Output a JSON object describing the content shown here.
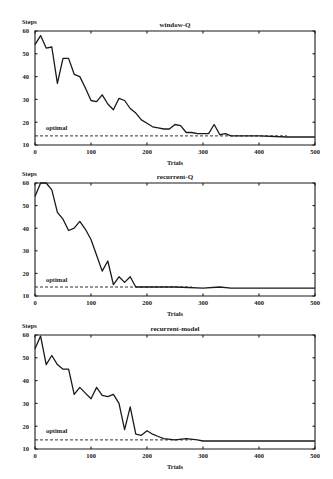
{
  "chart_data": [
    {
      "type": "line",
      "title": "window-Q",
      "xlabel": "Trials",
      "ylabel": "Steps",
      "xlim": [
        0,
        500
      ],
      "ylim": [
        10,
        60
      ],
      "xticks": [
        0,
        100,
        200,
        300,
        400,
        500
      ],
      "yticks": [
        10,
        20,
        30,
        40,
        50,
        60
      ],
      "grid": false,
      "annotations": [
        {
          "text": "optimal",
          "y": 14
        }
      ],
      "series": [
        {
          "name": "window-Q",
          "x": [
            0,
            10,
            20,
            30,
            40,
            50,
            60,
            70,
            80,
            90,
            100,
            110,
            120,
            130,
            140,
            150,
            160,
            170,
            180,
            190,
            200,
            210,
            220,
            230,
            240,
            250,
            260,
            270,
            280,
            290,
            300,
            310,
            320,
            330,
            340,
            350,
            400,
            450,
            500
          ],
          "values": [
            54,
            58,
            52.5,
            53,
            37,
            48,
            48,
            41,
            40,
            35,
            29.5,
            29,
            32,
            28,
            25.5,
            30.5,
            29.5,
            26,
            24,
            21,
            19.5,
            18,
            17.5,
            17,
            17,
            19,
            18.5,
            15.5,
            15.5,
            15,
            15,
            15,
            19,
            14.5,
            15,
            14,
            14,
            13.5,
            13.5
          ]
        },
        {
          "name": "optimal",
          "x": [
            0,
            450
          ],
          "values": [
            14,
            14
          ],
          "style": "dashed"
        }
      ]
    },
    {
      "type": "line",
      "title": "recurrent-Q",
      "xlabel": "Trials",
      "ylabel": "Steps",
      "xlim": [
        0,
        500
      ],
      "ylim": [
        10,
        60
      ],
      "xticks": [
        0,
        100,
        200,
        300,
        400,
        500
      ],
      "yticks": [
        10,
        20,
        30,
        40,
        50,
        60
      ],
      "grid": false,
      "annotations": [
        {
          "text": "optimal",
          "y": 14
        }
      ],
      "series": [
        {
          "name": "recurrent-Q",
          "x": [
            0,
            10,
            20,
            30,
            40,
            50,
            60,
            70,
            80,
            90,
            100,
            110,
            120,
            130,
            140,
            150,
            160,
            170,
            180,
            200,
            250,
            300,
            330,
            350,
            500
          ],
          "values": [
            54,
            60,
            60,
            57,
            47,
            44,
            39,
            40,
            43,
            39.5,
            35,
            28,
            21,
            25.5,
            15,
            18.5,
            16,
            18.5,
            14,
            14,
            14,
            13.5,
            14,
            13.5,
            13.5
          ]
        },
        {
          "name": "optimal",
          "x": [
            0,
            280
          ],
          "values": [
            14,
            14
          ],
          "style": "dashed"
        }
      ]
    },
    {
      "type": "line",
      "title": "recurrent-model",
      "xlabel": "Trials",
      "ylabel": "Steps",
      "xlim": [
        0,
        500
      ],
      "ylim": [
        10,
        60
      ],
      "xticks": [
        0,
        100,
        200,
        300,
        400,
        500
      ],
      "yticks": [
        10,
        20,
        30,
        40,
        50,
        60
      ],
      "grid": false,
      "annotations": [
        {
          "text": "optimal",
          "y": 14
        }
      ],
      "series": [
        {
          "name": "recurrent-model",
          "x": [
            0,
            10,
            20,
            30,
            40,
            50,
            60,
            70,
            80,
            90,
            100,
            110,
            120,
            130,
            140,
            150,
            160,
            170,
            180,
            190,
            200,
            210,
            220,
            230,
            250,
            270,
            290,
            300,
            350,
            500
          ],
          "values": [
            54,
            59.5,
            47,
            51,
            47,
            45,
            45,
            34,
            37,
            34.5,
            32,
            37,
            33.5,
            33,
            34,
            30,
            18.5,
            28.5,
            16.5,
            16,
            18,
            16.5,
            15.5,
            14.5,
            14,
            14.5,
            14,
            13.5,
            13.5,
            13.5
          ]
        },
        {
          "name": "optimal",
          "x": [
            0,
            280
          ],
          "values": [
            14,
            14
          ],
          "style": "dashed"
        }
      ]
    }
  ],
  "panels": [
    {
      "title": "window-Q",
      "ylabel": "Steps",
      "xlabel": "Trials",
      "optimal_label": "optimal",
      "xtick_labels": [
        "0",
        "100",
        "200",
        "300",
        "400",
        "500"
      ],
      "ytick_labels": [
        "10",
        "20",
        "30",
        "40",
        "50",
        "60"
      ]
    },
    {
      "title": "recurrent-Q",
      "ylabel": "Steps",
      "xlabel": "Trials",
      "optimal_label": "optimal",
      "xtick_labels": [
        "0",
        "100",
        "200",
        "300",
        "400",
        "500"
      ],
      "ytick_labels": [
        "10",
        "20",
        "30",
        "40",
        "50",
        "60"
      ]
    },
    {
      "title": "recurrent-model",
      "ylabel": "Steps",
      "xlabel": "Trials",
      "optimal_label": "optimal",
      "xtick_labels": [
        "0",
        "100",
        "200",
        "300",
        "400",
        "500"
      ],
      "ytick_labels": [
        "10",
        "20",
        "30",
        "40",
        "50",
        "60"
      ]
    }
  ]
}
